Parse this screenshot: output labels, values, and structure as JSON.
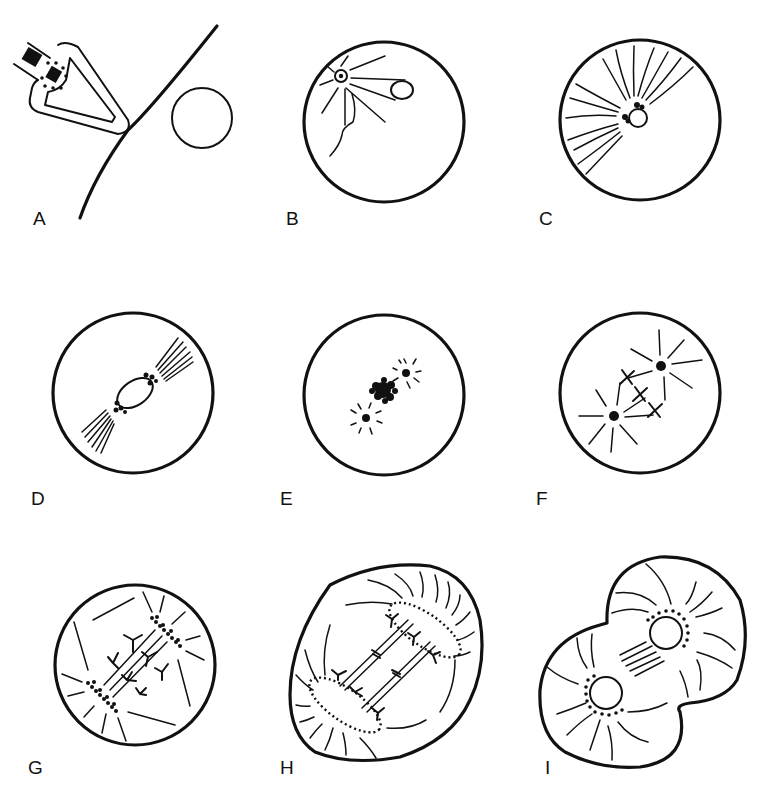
{
  "figure": {
    "panels": [
      {
        "id": "A",
        "label": "A",
        "content": "sperm acrosome contacting egg membrane; egg nucleus"
      },
      {
        "id": "B",
        "label": "B",
        "content": "sperm aster near egg surface with sperm tail; female pronucleus"
      },
      {
        "id": "C",
        "label": "C",
        "content": "sperm aster fibers around pronucleus"
      },
      {
        "id": "D",
        "label": "D",
        "content": "zygote nucleus with two spindle fiber bundles"
      },
      {
        "id": "E",
        "label": "E",
        "content": "chromatin cluster flanked by two asters"
      },
      {
        "id": "F",
        "label": "F",
        "content": "two asters with chromosomes aligned between them"
      },
      {
        "id": "G",
        "label": "G",
        "content": "anaphase: chromosomes migrating to two poles"
      },
      {
        "id": "H",
        "label": "H",
        "content": "telophase: elongated cell with re-forming nuclear envelopes"
      },
      {
        "id": "I",
        "label": "I",
        "content": "cleavage furrow forming two daughter cells with nuclei"
      }
    ]
  }
}
